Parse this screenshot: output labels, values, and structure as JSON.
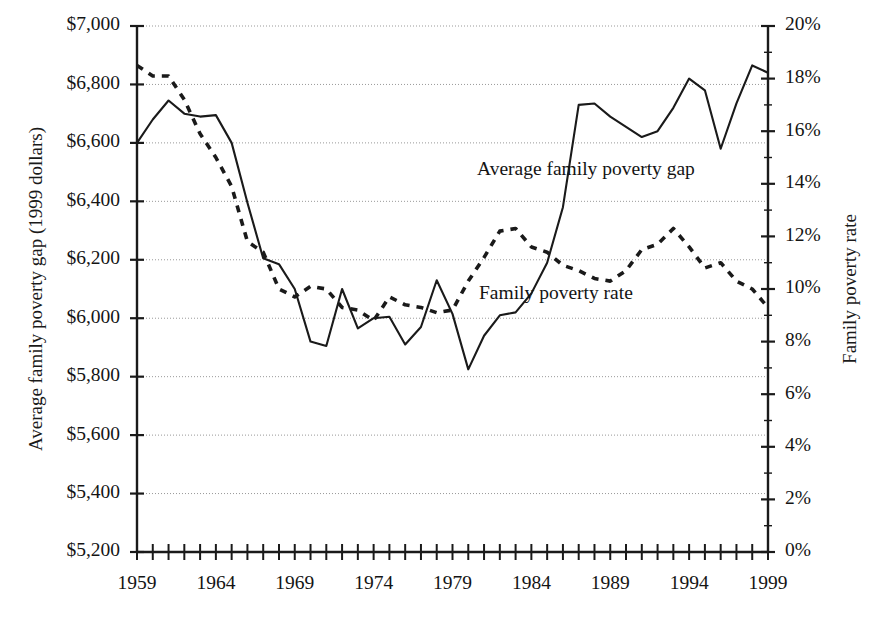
{
  "chart_data": {
    "type": "line",
    "title": "",
    "xlabel": "",
    "ylabel": "Average family poverty gap (1999 dollars)",
    "y2label": "Family poverty rate",
    "xlim": [
      1959,
      1999
    ],
    "ylim": [
      5200,
      7000
    ],
    "y2lim": [
      0,
      20
    ],
    "grid": true,
    "legend_position": "inline-annotation",
    "y_tick_labels": [
      "$7,000",
      "$6,800",
      "$6,600",
      "$6,400",
      "$6,200",
      "$6,000",
      "$5,800",
      "$5,600",
      "$5,400",
      "$5,200"
    ],
    "y_tick_values": [
      7000,
      6800,
      6600,
      6400,
      6200,
      6000,
      5800,
      5600,
      5400,
      5200
    ],
    "y2_tick_labels": [
      "20%",
      "18%",
      "16%",
      "14%",
      "12%",
      "10%",
      "8%",
      "6%",
      "4%",
      "2%",
      "0%"
    ],
    "y2_tick_values": [
      20,
      18,
      16,
      14,
      12,
      10,
      8,
      6,
      4,
      2,
      0
    ],
    "x_tick_labels": [
      "1959",
      "1964",
      "1969",
      "1974",
      "1979",
      "1984",
      "1989",
      "1994",
      "1999"
    ],
    "x_tick_values": [
      1959,
      1964,
      1969,
      1974,
      1979,
      1984,
      1989,
      1994,
      1999
    ],
    "x": [
      1959,
      1960,
      1961,
      1962,
      1963,
      1964,
      1965,
      1966,
      1967,
      1968,
      1969,
      1970,
      1971,
      1972,
      1973,
      1974,
      1975,
      1976,
      1977,
      1978,
      1979,
      1980,
      1981,
      1982,
      1983,
      1984,
      1985,
      1986,
      1987,
      1988,
      1989,
      1990,
      1991,
      1992,
      1993,
      1994,
      1995,
      1996,
      1997,
      1998,
      1999
    ],
    "series": [
      {
        "name": "Average family poverty gap",
        "axis": "left",
        "units": "1999 dollars",
        "style": "solid",
        "values": [
          6600,
          6680,
          6745,
          6700,
          6690,
          6695,
          6600,
          6395,
          6205,
          6185,
          6100,
          5920,
          5905,
          6100,
          5965,
          6000,
          6005,
          5910,
          5970,
          6130,
          6015,
          5825,
          5940,
          6010,
          6020,
          6085,
          6190,
          6380,
          6730,
          6735,
          6690,
          6655,
          6620,
          6640,
          6720,
          6820,
          6780,
          6580,
          6735,
          6865,
          6840
        ]
      },
      {
        "name": "Family poverty rate",
        "axis": "right",
        "units": "percent",
        "style": "dashed",
        "values": [
          18.5,
          18.1,
          18.1,
          17.2,
          15.9,
          15.0,
          13.9,
          11.8,
          11.4,
          10.0,
          9.7,
          10.1,
          10.0,
          9.3,
          9.2,
          8.8,
          9.7,
          9.4,
          9.3,
          9.1,
          9.2,
          10.3,
          11.2,
          12.2,
          12.3,
          11.6,
          11.4,
          10.9,
          10.7,
          10.4,
          10.3,
          10.7,
          11.5,
          11.7,
          12.3,
          11.6,
          10.8,
          11.0,
          10.3,
          10.0,
          9.3
        ]
      }
    ],
    "annotations": [
      {
        "text": "Average family poverty gap",
        "x_px": 477,
        "y_px": 171
      },
      {
        "text": "Family poverty rate",
        "x_px": 479,
        "y_px": 295
      }
    ]
  },
  "layout": {
    "plot_left_px": 137,
    "plot_right_px": 768,
    "plot_top_px": 26,
    "plot_bottom_px": 552,
    "accent_color": "#1a1a1a",
    "grid_color": "#999999",
    "background": "#ffffff"
  }
}
